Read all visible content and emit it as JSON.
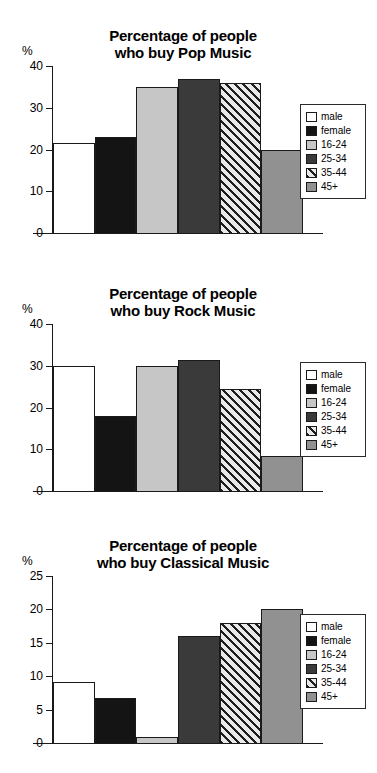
{
  "page": {
    "background": "#ffffff",
    "axis_color": "#1a1a1a"
  },
  "legend": {
    "entries": [
      {
        "label": "male",
        "swatch": "white",
        "color": "#ffffff"
      },
      {
        "label": "female",
        "swatch": "black",
        "color": "#141414"
      },
      {
        "label": "16-24",
        "swatch": "light-gray",
        "color": "#c6c6c6"
      },
      {
        "label": "25-34",
        "swatch": "dark-gray",
        "color": "#3a3a3a"
      },
      {
        "label": "35-44",
        "swatch": "diagonal-hatch",
        "color": "#e9e9e9"
      },
      {
        "label": "45+",
        "swatch": "medium-gray",
        "color": "#919191"
      }
    ]
  },
  "charts": [
    {
      "id": "pop",
      "title_line1": "Percentage of people",
      "title_line2": "who buy Pop Music",
      "axis_unit": "%"
    },
    {
      "id": "rock",
      "title_line1": "Percentage of people",
      "title_line2": "who buy Rock Music",
      "axis_unit": "%"
    },
    {
      "id": "classical",
      "title_line1": "Percentage of people",
      "title_line2": "who buy Classical Music",
      "axis_unit": "%"
    }
  ],
  "chart_data": [
    {
      "type": "bar",
      "title": "Percentage of people who buy Pop Music",
      "xlabel": "",
      "ylabel": "%",
      "ylim": [
        0,
        40
      ],
      "yticks": [
        0,
        10,
        20,
        30,
        40
      ],
      "ytick_labels": [
        "0",
        "10",
        "20",
        "30",
        "40"
      ],
      "grid": false,
      "legend_position": "right",
      "categories": [
        "male",
        "female",
        "16-24",
        "25-34",
        "35-44",
        "45+"
      ],
      "values": [
        21.5,
        23,
        35,
        37,
        36,
        20
      ]
    },
    {
      "type": "bar",
      "title": "Percentage of people who buy Rock Music",
      "xlabel": "",
      "ylabel": "%",
      "ylim": [
        0,
        40
      ],
      "yticks": [
        0,
        10,
        20,
        30,
        40
      ],
      "ytick_labels": [
        "0",
        "10",
        "20",
        "30",
        "40"
      ],
      "grid": false,
      "legend_position": "right",
      "categories": [
        "male",
        "female",
        "16-24",
        "25-34",
        "35-44",
        "45+"
      ],
      "values": [
        30,
        18,
        30,
        31.5,
        24.5,
        8.3
      ]
    },
    {
      "type": "bar",
      "title": "Percentage of people who buy Classical Music",
      "xlabel": "",
      "ylabel": "%",
      "ylim": [
        0,
        25
      ],
      "yticks": [
        0,
        5,
        10,
        15,
        20,
        25
      ],
      "ytick_labels": [
        "0",
        "5",
        "10",
        "15",
        "20",
        "25"
      ],
      "grid": false,
      "legend_position": "right",
      "categories": [
        "male",
        "female",
        "16-24",
        "25-34",
        "35-44",
        "45+"
      ],
      "values": [
        9.1,
        6.8,
        0.9,
        16,
        18,
        20
      ]
    }
  ]
}
